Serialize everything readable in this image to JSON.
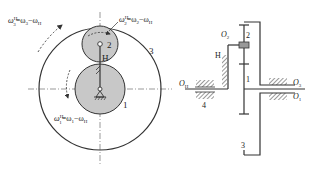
{
  "figure": {
    "type": "planetary-gear-train",
    "left_view": {
      "eq_ring": {
        "omega": "ω",
        "sup": "H",
        "sub": "3",
        "rhs": "=ω",
        "rhs_sub": "3",
        "minus": "−ω",
        "minus_sub": "H"
      },
      "eq_planet": {
        "omega": "ω",
        "sup": "H",
        "sub": "2",
        "rhs": "=ω",
        "rhs_sub": "2",
        "minus": "−ω",
        "minus_sub": "H"
      },
      "eq_sun": {
        "omega": "ω",
        "sup": "H",
        "sub": "1",
        "rhs": "=ω",
        "rhs_sub": "1",
        "minus": "−ω",
        "minus_sub": "H"
      },
      "labels": {
        "planet": "2",
        "carrier": "H",
        "ring": "3",
        "sun": "1"
      }
    },
    "right_view": {
      "labels": {
        "O2": "O",
        "O2_sub": "2",
        "planet": "2",
        "carrier": "H",
        "sun": "1",
        "OH": "O",
        "OH_sub": "H",
        "O3": "O",
        "O3_sub": "3",
        "O1": "O",
        "O1_sub": "1",
        "frame": "4",
        "ring": "3"
      }
    },
    "colors": {
      "gear_fill": "#c8c8c8",
      "line": "#333333",
      "background": "#ffffff"
    }
  }
}
